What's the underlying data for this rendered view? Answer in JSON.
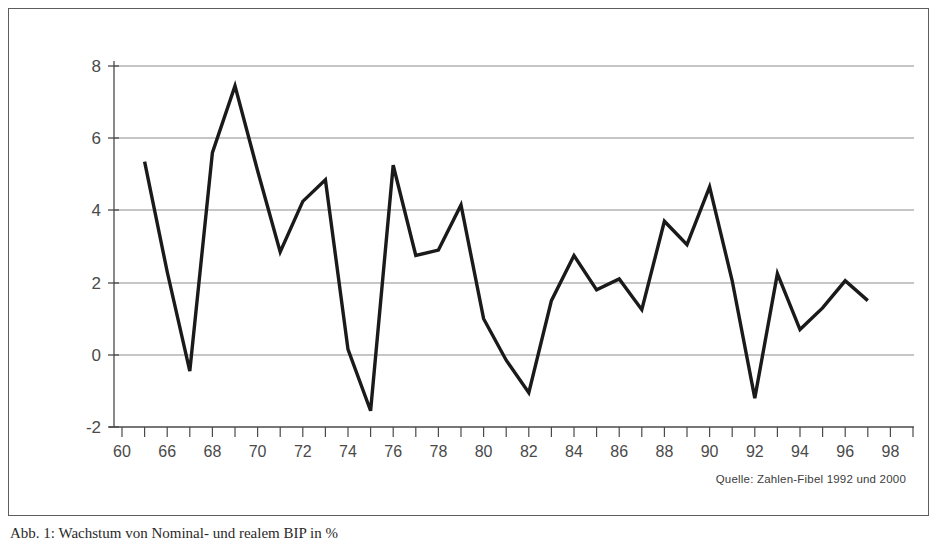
{
  "figure": {
    "source_note": "Quelle: Zahlen-Fibel 1992 und 2000",
    "caption": "Abb. 1: Wachstum von Nominal- und realem BIP in %"
  },
  "chart_data": {
    "type": "line",
    "title": "",
    "xlabel": "",
    "ylabel": "",
    "ylim": [
      -2,
      8
    ],
    "yticks": [
      -2,
      0,
      2,
      4,
      6,
      8
    ],
    "ytick_labels": [
      "-2",
      "0",
      "2",
      "4",
      "6",
      "8"
    ],
    "grid": "horizontal",
    "legend": "none",
    "line_color": "#1a1a1a",
    "line_width": 3.4,
    "xtick_labels": [
      "60",
      "",
      "66",
      "",
      "68",
      "",
      "70",
      "",
      "72",
      "",
      "74",
      "",
      "76",
      "",
      "78",
      "",
      "80",
      "",
      "82",
      "",
      "84",
      "",
      "86",
      "",
      "88",
      "",
      "90",
      "",
      "92",
      "",
      "94",
      "",
      "96",
      "",
      "98",
      ""
    ],
    "x": [
      "60",
      "61",
      "66",
      "67",
      "68",
      "69",
      "70",
      "71",
      "72",
      "73",
      "74",
      "75",
      "76",
      "77",
      "78",
      "79",
      "80",
      "81",
      "82",
      "83",
      "84",
      "85",
      "86",
      "87",
      "88",
      "89",
      "90",
      "91",
      "92",
      "93",
      "94",
      "95",
      "96",
      "97",
      "98",
      "99"
    ],
    "categories": [
      "60",
      "61",
      "66",
      "67",
      "68",
      "69",
      "70",
      "71",
      "72",
      "73",
      "74",
      "75",
      "76",
      "77",
      "78",
      "79",
      "80",
      "81",
      "82",
      "83",
      "84",
      "85",
      "86",
      "87",
      "88",
      "89",
      "90",
      "91",
      "92",
      "93",
      "94",
      "95",
      "96",
      "97",
      "98",
      "99"
    ],
    "values": [
      null,
      5.35,
      -0.45,
      5.6,
      7.45,
      5.1,
      2.85,
      4.25,
      4.85,
      0.15,
      -1.55,
      5.25,
      2.75,
      2.9,
      4.15,
      1.0,
      -0.15,
      -1.05,
      1.5,
      2.75,
      1.8,
      2.1,
      1.25,
      3.7,
      3.05,
      4.65,
      2.05,
      -1.2,
      2.25,
      0.7,
      1.3,
      2.05,
      1.5,
      null,
      null,
      null
    ],
    "series": [
      {
        "name": "Wachstumsrate",
        "points": [
          {
            "x": "61",
            "y": 5.35
          },
          {
            "x": "62",
            "y": 2.3
          },
          {
            "x": "63",
            "y": -0.45
          },
          {
            "x": "64",
            "y": 5.6
          },
          {
            "x": "65",
            "y": 7.45
          },
          {
            "x": "66",
            "y": 5.1
          },
          {
            "x": "67",
            "y": 2.85
          },
          {
            "x": "68",
            "y": 4.25
          },
          {
            "x": "69",
            "y": 4.85
          },
          {
            "x": "70",
            "y": 0.15
          },
          {
            "x": "71",
            "y": -1.55
          },
          {
            "x": "72",
            "y": 5.25
          },
          {
            "x": "73",
            "y": 2.75
          },
          {
            "x": "74",
            "y": 2.9
          },
          {
            "x": "75",
            "y": 4.15
          },
          {
            "x": "76",
            "y": 1.0
          },
          {
            "x": "77",
            "y": -0.15
          },
          {
            "x": "78",
            "y": -1.05
          },
          {
            "x": "79",
            "y": 1.5
          },
          {
            "x": "80",
            "y": 2.75
          },
          {
            "x": "81",
            "y": 1.8
          },
          {
            "x": "82",
            "y": 2.1
          },
          {
            "x": "83",
            "y": 1.25
          },
          {
            "x": "84",
            "y": 3.7
          },
          {
            "x": "85",
            "y": 3.05
          },
          {
            "x": "86",
            "y": 4.65
          },
          {
            "x": "87",
            "y": 2.05
          },
          {
            "x": "88",
            "y": -1.2
          },
          {
            "x": "89",
            "y": 2.25
          },
          {
            "x": "90",
            "y": 0.7
          },
          {
            "x": "91",
            "y": 1.3
          },
          {
            "x": "92",
            "y": 2.05
          },
          {
            "x": "93",
            "y": 1.5
          }
        ]
      }
    ]
  }
}
